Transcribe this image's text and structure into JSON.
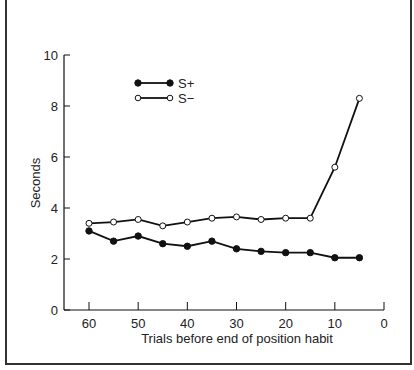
{
  "figure": {
    "title": "FIGURE 5.2"
  },
  "chart_data": {
    "type": "line",
    "title": "FIGURE 5.2",
    "xlabel": "Trials before end of position habit",
    "ylabel": "Seconds",
    "xlim": [
      65,
      0
    ],
    "ylim": [
      0,
      10
    ],
    "x_ticks": [
      60,
      50,
      40,
      30,
      20,
      10,
      0
    ],
    "y_ticks": [
      0,
      2,
      4,
      6,
      8,
      10
    ],
    "grid": false,
    "legend_position": "upper-left-center",
    "x": [
      60,
      55,
      50,
      45,
      40,
      35,
      30,
      25,
      20,
      15,
      10,
      5
    ],
    "series": [
      {
        "name": "S+",
        "marker": "filled-circle",
        "values": [
          3.1,
          2.7,
          2.9,
          2.6,
          2.5,
          2.7,
          2.4,
          2.3,
          2.25,
          2.25,
          2.05,
          2.05
        ]
      },
      {
        "name": "S−",
        "marker": "open-circle",
        "values": [
          3.4,
          3.45,
          3.55,
          3.3,
          3.45,
          3.6,
          3.65,
          3.55,
          3.6,
          3.6,
          5.6,
          8.3
        ]
      }
    ]
  },
  "colors": {
    "titlebar": "#0a0a0a",
    "line": "#111111",
    "frame": "#333333"
  }
}
